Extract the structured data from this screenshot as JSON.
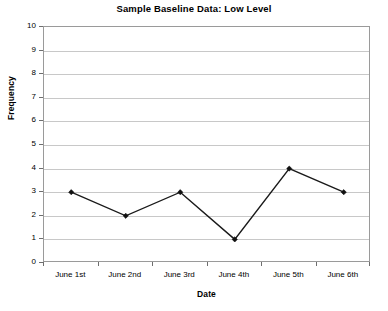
{
  "chart_data": {
    "type": "line",
    "title": "Sample Baseline Data: Low Level",
    "xlabel": "Date",
    "ylabel": "Frequency",
    "categories": [
      "June 1st",
      "June 2nd",
      "June 3rd",
      "June 4th",
      "June 5th",
      "June 6th"
    ],
    "values": [
      3,
      2,
      3,
      1,
      4,
      3
    ],
    "series": [
      {
        "name": "Frequency",
        "values": [
          3,
          2,
          3,
          1,
          4,
          3
        ]
      }
    ],
    "ylim": [
      0,
      10
    ],
    "yticks": [
      0,
      1,
      2,
      3,
      4,
      5,
      6,
      7,
      8,
      9,
      10
    ],
    "ytick_labels": [
      "0",
      "1",
      "2",
      "3",
      "4",
      "5",
      "6",
      "7",
      "8",
      "9",
      "10"
    ],
    "grid": "horizontal",
    "legend": "none",
    "marker": "diamond",
    "line_color": "#1a1a1a",
    "gridline_color": "#c8c8c8",
    "axis_color": "#9a9a9a",
    "background": "#ffffff"
  }
}
